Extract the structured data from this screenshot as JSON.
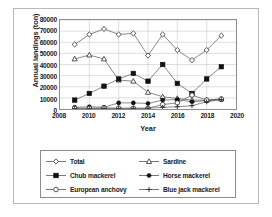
{
  "chart_data": {
    "type": "line",
    "title": "",
    "xlabel": "Year",
    "ylabel": "Annual landings (ton)",
    "xlim": [
      2008,
      2020
    ],
    "ylim": [
      0,
      80000
    ],
    "xticks": [
      2008,
      2010,
      2012,
      2014,
      2016,
      2018,
      2020
    ],
    "yticks": [
      0,
      10000,
      20000,
      30000,
      40000,
      50000,
      60000,
      70000,
      80000
    ],
    "grid": "horizontal-and-vertical",
    "legend_position": "bottom",
    "x": [
      2009,
      2010,
      2011,
      2012,
      2013,
      2014,
      2015,
      2016,
      2017,
      2018,
      2019
    ],
    "series": [
      {
        "name": "Total",
        "marker": "diamond-open",
        "values": [
          58000,
          67000,
          72000,
          67000,
          68000,
          48000,
          67000,
          53000,
          44000,
          53000,
          66000
        ]
      },
      {
        "name": "Sardine",
        "marker": "triangle-open",
        "values": [
          45000,
          48500,
          45000,
          26000,
          25000,
          15000,
          11000,
          9500,
          8000,
          8000,
          9000
        ]
      },
      {
        "name": "Chub mackerel",
        "marker": "square-filled",
        "values": [
          8000,
          14000,
          20500,
          27000,
          32000,
          25000,
          40000,
          23000,
          14000,
          27000,
          38000
        ]
      },
      {
        "name": "Horse mackerel",
        "marker": "circle-filled",
        "values": [
          1500,
          2000,
          1500,
          5500,
          5500,
          5000,
          8000,
          8500,
          6500,
          7500,
          8500
        ]
      },
      {
        "name": "European anchovy",
        "marker": "circle-open",
        "values": [
          700,
          700,
          1000,
          800,
          700,
          700,
          4000,
          5500,
          12500,
          8000,
          9000
        ]
      },
      {
        "name": "Blue jack mackerel",
        "marker": "plus",
        "values": [
          300,
          300,
          500,
          500,
          600,
          700,
          1500,
          2000,
          3000,
          6500,
          8500
        ]
      }
    ]
  },
  "legend": {
    "items": [
      {
        "label": "Total"
      },
      {
        "label": "Sardine"
      },
      {
        "label": "Chub mackerel"
      },
      {
        "label": "Horse mackerel"
      },
      {
        "label": "European anchovy"
      },
      {
        "label": "Blue jack mackerel"
      }
    ]
  }
}
